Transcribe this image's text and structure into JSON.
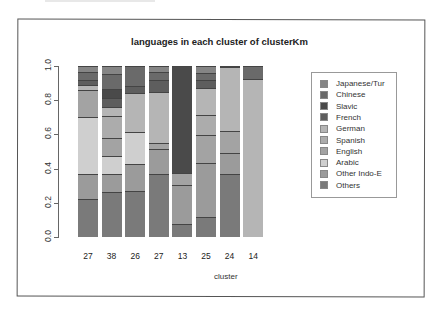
{
  "chart_data": {
    "type": "bar",
    "stacked": true,
    "title": "languages in each cluster of clusterKm",
    "xlabel": "cluster",
    "ylabel": "",
    "ylim": [
      0,
      1
    ],
    "yticks": [
      "0.0",
      "0.2",
      "0.4",
      "0.6",
      "0.8",
      "1.0"
    ],
    "categories": [
      "27",
      "38",
      "26",
      "27",
      "13",
      "25",
      "24",
      "14"
    ],
    "legend_position": "right",
    "series": [
      {
        "name": "Others",
        "color": "#7a7a7a",
        "values": [
          0.224,
          0.263,
          0.269,
          0.366,
          0.074,
          0.115,
          0.366,
          0.0
        ]
      },
      {
        "name": "Other Indo-E",
        "color": "#9b9b9b",
        "values": [
          0.147,
          0.103,
          0.156,
          0.151,
          0.228,
          0.318,
          0.125,
          0.0
        ]
      },
      {
        "name": "Arabic",
        "color": "#cfcfcf",
        "values": [
          0.331,
          0.106,
          0.189,
          0.0,
          0.0,
          0.0,
          0.0,
          0.0
        ]
      },
      {
        "name": "English",
        "color": "#a3a3a3",
        "values": [
          0.156,
          0.109,
          0.0,
          0.033,
          0.074,
          0.162,
          0.127,
          0.0
        ]
      },
      {
        "name": "Spanish",
        "color": "#acacac",
        "values": [
          0.0,
          0.127,
          0.0,
          0.0,
          0.0,
          0.12,
          0.0,
          0.0
        ]
      },
      {
        "name": "German",
        "color": "#b5b5b5",
        "values": [
          0.029,
          0.052,
          0.228,
          0.298,
          0.0,
          0.156,
          0.374,
          0.922
        ]
      },
      {
        "name": "French",
        "color": "#5e5e5e",
        "values": [
          0.029,
          0.053,
          0.039,
          0.072,
          0.0,
          0.045,
          0.0,
          0.0
        ]
      },
      {
        "name": "Slavic",
        "color": "#4a4a4a",
        "values": [
          0.0,
          0.054,
          0.0,
          0.0,
          0.624,
          0.0,
          0.0,
          0.0
        ]
      },
      {
        "name": "Chinese",
        "color": "#6a6a6a",
        "values": [
          0.049,
          0.084,
          0.119,
          0.045,
          0.0,
          0.043,
          0.0,
          0.078
        ]
      },
      {
        "name": "Japanese/Tur",
        "color": "#858585",
        "values": [
          0.035,
          0.049,
          0.0,
          0.035,
          0.0,
          0.041,
          0.008,
          0.0
        ]
      }
    ],
    "legend": [
      "Japanese/Tur",
      "Chinese",
      "Slavic",
      "French",
      "German",
      "Spanish",
      "English",
      "Arabic",
      "Other Indo-E",
      "Others"
    ]
  }
}
